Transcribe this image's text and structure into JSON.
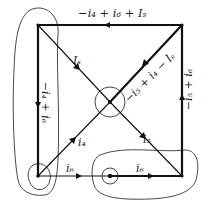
{
  "diagram": {
    "type": "circuit-graph",
    "colors": {
      "line": "#111111",
      "contour": "#333333",
      "background": "#ffffff"
    },
    "nodes": [
      {
        "id": "top-left",
        "x": 38,
        "y": 25
      },
      {
        "id": "top-right",
        "x": 182,
        "y": 25
      },
      {
        "id": "bottom-left",
        "x": 38,
        "y": 176
      },
      {
        "id": "bottom-right",
        "x": 182,
        "y": 176
      },
      {
        "id": "center",
        "x": 110,
        "y": 102
      },
      {
        "id": "bottom-middle",
        "x": 110,
        "y": 176
      }
    ],
    "branches": [
      {
        "id": "top",
        "from": "top-right",
        "to": "top-left",
        "label": "−i4 + i6 + Is",
        "thick": true
      },
      {
        "id": "left",
        "from": "top-left",
        "to": "bottom-left",
        "label": "−i4 + i6",
        "thick": true
      },
      {
        "id": "right",
        "from": "bottom-right",
        "to": "top-right",
        "label": "−i5 + i6",
        "thick": true
      },
      {
        "id": "diag-tl",
        "from": "top-left",
        "to": "center",
        "label": "Is",
        "thick": false
      },
      {
        "id": "diag-tr",
        "from": "top-right",
        "to": "center",
        "label": "−i5 + i4 − Is",
        "thick": true
      },
      {
        "id": "diag-bl",
        "from": "bottom-left",
        "to": "center",
        "label": "i4",
        "thick": false
      },
      {
        "id": "diag-br",
        "from": "center",
        "to": "bottom-right",
        "label": "i5",
        "thick": false
      },
      {
        "id": "bottom-left-seg",
        "from": "bottom-left",
        "to": "bottom-middle",
        "label": "i6",
        "thick": false
      },
      {
        "id": "bottom-right-seg",
        "from": "bottom-middle",
        "to": "bottom-right",
        "label": "i6",
        "thick": true
      }
    ],
    "labels": {
      "top": "−i₄ + i₆ + Iₛ",
      "left": "−i₄ + i₆",
      "right": "−i₅ + i₆",
      "diag_tl": "Iₛ",
      "diag_tr": "−i₅ + i₄ − Iₛ",
      "diag_bl": "i₄",
      "diag_br": "i₅",
      "bottom_left": "i₆",
      "bottom_right": "i₆"
    },
    "contours": [
      "left-supernode-loop",
      "center-node-circle",
      "bottom-left-node-circle",
      "bottom-middle-node-circle",
      "bottom-right-supernode-loop"
    ]
  }
}
